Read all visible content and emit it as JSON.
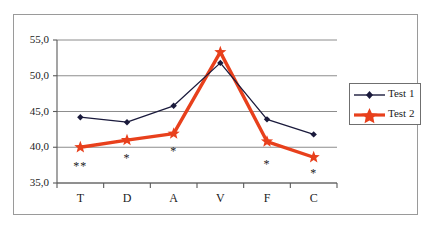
{
  "chart_data": {
    "type": "line",
    "title": "",
    "xlabel": "",
    "ylabel": "",
    "categories": [
      "T",
      "D",
      "A",
      "V",
      "F",
      "C"
    ],
    "ylim": [
      35.0,
      55.0
    ],
    "ytick_labels": [
      "55,0",
      "50,0",
      "45,0",
      "40,0",
      "35,0"
    ],
    "ytick_values": [
      55.0,
      50.0,
      45.0,
      40.0,
      35.0
    ],
    "grid": true,
    "legend_position": "right",
    "series": [
      {
        "name": "Test 1",
        "color": "#1a1a3c",
        "marker": "diamond",
        "values": [
          44.2,
          43.5,
          45.8,
          51.8,
          43.9,
          41.8
        ]
      },
      {
        "name": "Test 2",
        "color": "#e8401c",
        "marker": "star",
        "values": [
          40.0,
          41.0,
          41.9,
          53.3,
          40.8,
          38.6
        ]
      }
    ],
    "annotations": [
      {
        "category": "T",
        "text": "**",
        "value": 37.3
      },
      {
        "category": "D",
        "text": "*",
        "value": 38.4
      },
      {
        "category": "A",
        "text": "*",
        "value": 39.4
      },
      {
        "category": "F",
        "text": "*",
        "value": 37.5
      },
      {
        "category": "C",
        "text": "*",
        "value": 36.3
      }
    ]
  },
  "colors": {
    "series1": "#1a1a3c",
    "series2": "#e8401c",
    "grid": "#808080",
    "axis": "#5a5a5a",
    "frame": "#9a9a9a",
    "text": "#1b1b1b",
    "background": "#ffffff"
  },
  "legend": {
    "entries": [
      {
        "label": "Test 1"
      },
      {
        "label": "Test 2"
      }
    ]
  },
  "axis": {
    "y_labels": [
      "55,0",
      "50,0",
      "45,0",
      "40,0",
      "35,0"
    ],
    "x_labels": [
      "T",
      "D",
      "A",
      "V",
      "F",
      "C"
    ]
  },
  "annotation_labels": [
    "**",
    "*",
    "*",
    "*",
    "*"
  ]
}
